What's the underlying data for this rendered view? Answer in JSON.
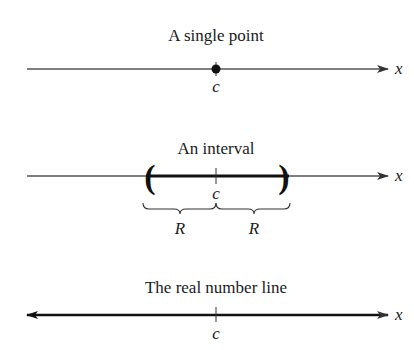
{
  "diagrams": {
    "single_point": {
      "title": "A single point",
      "point_label": "c",
      "axis_label": "x"
    },
    "interval": {
      "title": "An interval",
      "center_label": "c",
      "left_radius_label": "R",
      "right_radius_label": "R",
      "axis_label": "x",
      "left_endpoint": "(",
      "right_endpoint": ")"
    },
    "real_line": {
      "title": "The real number line",
      "tick_label": "c",
      "axis_label": "x"
    }
  },
  "colors": {
    "thin_line": "#555555",
    "thick_line": "#111111",
    "text": "#1a1a1a"
  }
}
